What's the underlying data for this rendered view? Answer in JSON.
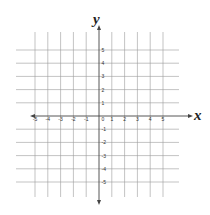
{
  "chart_data": {
    "type": "coordinate-plane",
    "xlabel": "x",
    "ylabel": "y",
    "xlim": [
      -5,
      5
    ],
    "ylim": [
      -5,
      5
    ],
    "grid": true,
    "x_ticks": [
      "-5",
      "-4",
      "-3",
      "-2",
      "-1",
      "0",
      "1",
      "2",
      "3",
      "4",
      "5"
    ],
    "y_ticks": [
      "5",
      "4",
      "3",
      "2",
      "1",
      "-1",
      "-2",
      "-3",
      "-4",
      "-5"
    ],
    "origin_label": "0",
    "colors": {
      "grid": "#9a9a9a",
      "axis": "#444444",
      "labels": "#333333"
    }
  }
}
